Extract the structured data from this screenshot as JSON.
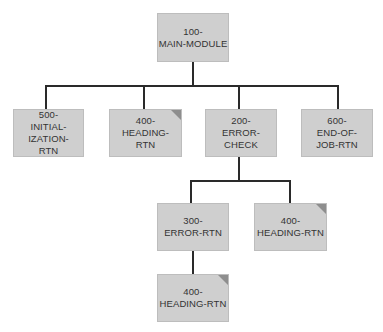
{
  "diagram": {
    "type": "hierarchy-chart",
    "colors": {
      "box_fill": "#cfcfcf",
      "box_border": "#bdbdbd",
      "connector": "#2a2a2a",
      "predefined_corner": "#8e8e8e"
    },
    "nodes": [
      {
        "id": "100",
        "label": "100-\nMAIN-MODULE",
        "predefined": false
      },
      {
        "id": "500",
        "label": "500-\nINITIAL-\nIZATION-\nRTN",
        "predefined": false
      },
      {
        "id": "400a",
        "label": "400-\nHEADING-\nRTN",
        "predefined": true
      },
      {
        "id": "200",
        "label": "200-\nERROR-\nCHECK",
        "predefined": false
      },
      {
        "id": "600",
        "label": "600-\nEND-OF-\nJOB-RTN",
        "predefined": false
      },
      {
        "id": "300",
        "label": "300-\nERROR-RTN",
        "predefined": false
      },
      {
        "id": "400b",
        "label": "400-\nHEADING-RTN",
        "predefined": true
      },
      {
        "id": "400c",
        "label": "400-\nHEADING-RTN",
        "predefined": true
      }
    ],
    "edges": [
      [
        "100",
        "500"
      ],
      [
        "100",
        "400a"
      ],
      [
        "100",
        "200"
      ],
      [
        "100",
        "600"
      ],
      [
        "200",
        "300"
      ],
      [
        "200",
        "400b"
      ],
      [
        "300",
        "400c"
      ]
    ]
  }
}
